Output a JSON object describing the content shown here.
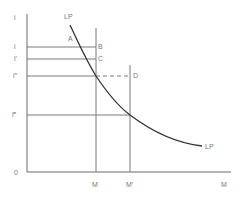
{
  "diagram": {
    "y_axis_label": "i",
    "x_axis_label": "M",
    "origin_label": "0",
    "curve_label_top": "LP",
    "curve_label_bottom": "LP",
    "rate_labels": [
      "i",
      "i′",
      "i″",
      "i‴"
    ],
    "point_labels": {
      "A": "A",
      "B": "B",
      "C": "C",
      "D": "D"
    },
    "x_tick_labels": [
      "M",
      "M′"
    ]
  }
}
